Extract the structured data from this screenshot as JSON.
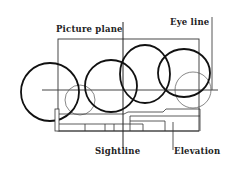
{
  "diagram": {
    "labels": {
      "picture_plane": "Picture plane",
      "eye_line": "Eye line",
      "sightline": "Sightline",
      "elevation": "Elevation"
    },
    "colors": {
      "ink": "#111111",
      "thin_line": "#555555",
      "background": "#ffffff"
    },
    "bold_circles": [
      {
        "cx": 50,
        "cy": 92,
        "r": 29
      },
      {
        "cx": 111,
        "cy": 86,
        "r": 26
      },
      {
        "cx": 145,
        "cy": 74,
        "r": 27
      },
      {
        "cx": 184,
        "cy": 73,
        "r": 25
      }
    ],
    "thin_circles": [
      {
        "cx": 80,
        "cy": 100,
        "r": 15
      },
      {
        "cx": 193,
        "cy": 90,
        "r": 18
      }
    ]
  }
}
